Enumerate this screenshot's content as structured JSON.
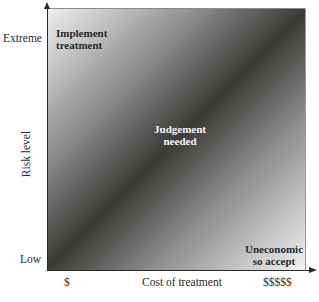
{
  "diagram": {
    "type": "risk-cost-matrix",
    "y_axis": {
      "title": "Risk level",
      "high_label": "Extreme",
      "low_label": "Low"
    },
    "x_axis": {
      "title": "Cost of treatment",
      "low_label": "$",
      "high_label": "$$$$$"
    },
    "regions": {
      "top_left": [
        "Implement",
        "treatment"
      ],
      "center": [
        "Judgement",
        "needed"
      ],
      "bottom_right": [
        "Uneconomic",
        "so accept"
      ]
    },
    "colors": {
      "light": "#efefef",
      "dark_diagonal": "#3c3a36",
      "axis": "#2a2a2a"
    }
  }
}
